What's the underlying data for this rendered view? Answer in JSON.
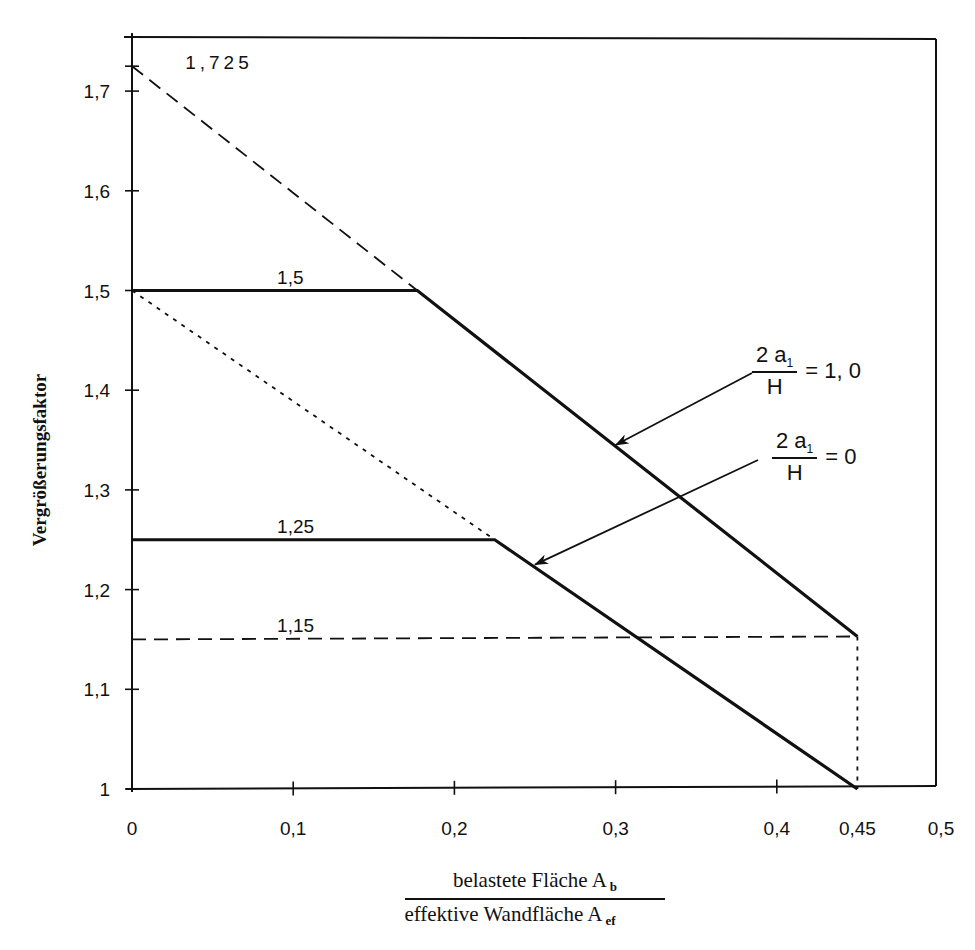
{
  "chart_data": {
    "type": "line",
    "title": "",
    "xlabel": {
      "numerator": "belastete Fläche A",
      "numerator_sub": "b",
      "denominator": "effektive Wandfläche A",
      "denominator_sub": "ef"
    },
    "ylabel": "Vergrößerungsfaktor",
    "xlim": [
      0,
      0.5
    ],
    "ylim": [
      1.0,
      1.75
    ],
    "grid": false,
    "x_ticks": [
      {
        "value": 0,
        "label": "0"
      },
      {
        "value": 0.1,
        "label": "0,1"
      },
      {
        "value": 0.2,
        "label": "0,2"
      },
      {
        "value": 0.3,
        "label": "0,3"
      },
      {
        "value": 0.4,
        "label": "0,4"
      },
      {
        "value": 0.45,
        "label": "0,45"
      },
      {
        "value": 0.5,
        "label": "0,5"
      }
    ],
    "y_ticks": [
      {
        "value": 1.0,
        "label": "1"
      },
      {
        "value": 1.1,
        "label": "1,1"
      },
      {
        "value": 1.2,
        "label": "1,2"
      },
      {
        "value": 1.3,
        "label": "1,3"
      },
      {
        "value": 1.4,
        "label": "1,4"
      },
      {
        "value": 1.5,
        "label": "1,5"
      },
      {
        "value": 1.6,
        "label": "1,6"
      },
      {
        "value": 1.7,
        "label": "1,7"
      },
      {
        "value": 1.725,
        "label": ""
      }
    ],
    "series": [
      {
        "name": "2a1/H = 1,0",
        "style": "solid",
        "x": [
          0,
          0.177,
          0.45
        ],
        "y": [
          1.5,
          1.5,
          1.153
        ]
      },
      {
        "name": "2a1/H = 0",
        "style": "solid",
        "x": [
          0,
          0.225,
          0.45
        ],
        "y": [
          1.25,
          1.25,
          1.0
        ]
      },
      {
        "name": "extension 1,725",
        "style": "dashed",
        "x": [
          0,
          0.177
        ],
        "y": [
          1.725,
          1.5
        ]
      },
      {
        "name": "extension 1,5",
        "style": "dotted",
        "x": [
          0,
          0.225
        ],
        "y": [
          1.5,
          1.25
        ]
      },
      {
        "name": "limit 1,15",
        "style": "dashed",
        "x": [
          0,
          0.45
        ],
        "y": [
          1.15,
          1.153
        ]
      },
      {
        "name": "limit 0,45",
        "style": "dotted",
        "x": [
          0.45,
          0.45
        ],
        "y": [
          1.153,
          1.0
        ]
      }
    ],
    "annotations": [
      {
        "text": "1,725",
        "x": 0.033,
        "y": 1.728
      },
      {
        "text": "1,5",
        "x": 0.09,
        "y": 1.513
      },
      {
        "text": "1,25",
        "x": 0.09,
        "y": 1.263
      },
      {
        "text": "1,15",
        "x": 0.09,
        "y": 1.163
      }
    ],
    "legend": [
      {
        "numerator": "2 a",
        "sub": "1",
        "denominator": "H",
        "value": "= 1, 0",
        "arrow_target": {
          "x": 0.3,
          "y": 1.345
        }
      },
      {
        "numerator": "2 a",
        "sub": "1",
        "denominator": "H",
        "value": "= 0",
        "arrow_target": {
          "x": 0.25,
          "y": 1.225
        }
      }
    ]
  }
}
